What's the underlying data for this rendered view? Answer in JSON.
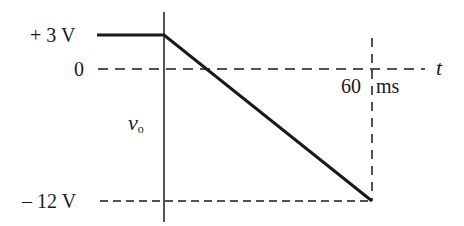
{
  "diagram": {
    "type": "voltage-waveform",
    "signal": {
      "name": "v",
      "subscript": "o"
    },
    "time_axis_label": "t",
    "labels": {
      "plus3": "+ 3 V",
      "zero": "0",
      "minus12": "– 12 V",
      "t60": "60",
      "t60_unit": "ms"
    },
    "waveform_points": [
      {
        "t_ms": "-inf",
        "v": 3
      },
      {
        "t_ms": 0,
        "v": 3
      },
      {
        "t_ms": 60,
        "v": -12
      }
    ],
    "colors": {
      "ink": "#1a1a1a",
      "background": "#ffffff"
    }
  }
}
